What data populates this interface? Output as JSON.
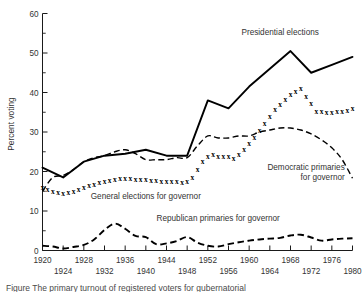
{
  "figure": {
    "caption_fragment": "Figure  The primary turnout of registered voters for gubernatorial"
  },
  "chart_data": {
    "type": "line",
    "title": "",
    "xlabel": "",
    "ylabel": "Percent voting",
    "xlim": [
      1920,
      1980
    ],
    "ylim": [
      0,
      60
    ],
    "grid": false,
    "legend_position": "inline-annotations",
    "yticks_major": [
      0,
      10,
      20,
      30,
      40,
      50,
      60
    ],
    "yticks_minor": [
      5,
      15,
      25,
      35,
      45,
      55
    ],
    "xticks_upper_row": [
      1920,
      1928,
      1936,
      1944,
      1952,
      1960,
      1968,
      1976
    ],
    "xticks_lower_row": [
      1924,
      1932,
      1940,
      1948,
      1956,
      1964,
      1972,
      1980
    ],
    "xticks_all": [
      1920,
      1924,
      1928,
      1932,
      1936,
      1940,
      1944,
      1948,
      1952,
      1956,
      1960,
      1964,
      1968,
      1972,
      1976,
      1980
    ],
    "series": [
      {
        "name": "Presidential elections",
        "style": "solid",
        "label_x": 1966,
        "label_y": 54.5,
        "x": [
          1920,
          1924,
          1928,
          1932,
          1936,
          1940,
          1944,
          1948,
          1952,
          1956,
          1960,
          1964,
          1968,
          1972,
          1976,
          1980
        ],
        "values": [
          21.0,
          18.5,
          22.5,
          24.0,
          24.5,
          25.5,
          24.0,
          24.0,
          38.0,
          36.0,
          41.5,
          46.0,
          50.5,
          45.0,
          47.0,
          49.0
        ]
      },
      {
        "name": "Democratic primaries for governor",
        "style": "dashed",
        "label_x": 1972,
        "label_y": 20.5,
        "x": [
          1920,
          1922,
          1924,
          1926,
          1928,
          1930,
          1932,
          1934,
          1936,
          1938,
          1940,
          1942,
          1944,
          1946,
          1948,
          1950,
          1952,
          1954,
          1956,
          1958,
          1960,
          1962,
          1964,
          1966,
          1968,
          1970,
          1972,
          1974,
          1976,
          1978,
          1980
        ],
        "values": [
          15.0,
          18.5,
          19.0,
          20.5,
          22.5,
          23.5,
          24.0,
          25.0,
          25.5,
          24.5,
          23.0,
          23.0,
          23.0,
          23.5,
          23.5,
          26.5,
          29.0,
          28.5,
          28.5,
          29.0,
          29.0,
          30.0,
          30.5,
          31.0,
          31.0,
          30.5,
          29.5,
          28.0,
          26.0,
          23.0,
          18.3
        ]
      },
      {
        "name": "General elections for governor",
        "style": "x-markers",
        "label_x": 1940,
        "label_y": 13.0,
        "x": [
          1920,
          1921,
          1922,
          1923,
          1924,
          1925,
          1926,
          1927,
          1928,
          1929,
          1930,
          1931,
          1932,
          1933,
          1934,
          1935,
          1936,
          1937,
          1938,
          1939,
          1940,
          1941,
          1942,
          1943,
          1944,
          1945,
          1946,
          1947,
          1948,
          1949,
          1950,
          1951,
          1952,
          1953,
          1954,
          1955,
          1956,
          1957,
          1958,
          1959,
          1960,
          1961,
          1962,
          1963,
          1964,
          1965,
          1966,
          1967,
          1968,
          1969,
          1970,
          1971,
          1972,
          1973,
          1974,
          1975,
          1976,
          1977,
          1978,
          1979,
          1980
        ],
        "values": [
          16.0,
          15.5,
          15.0,
          14.6,
          14.5,
          14.7,
          15.0,
          15.5,
          16.0,
          16.4,
          16.8,
          17.2,
          17.4,
          17.8,
          18.0,
          18.2,
          18.3,
          18.2,
          18.0,
          18.0,
          17.9,
          17.8,
          17.7,
          17.6,
          17.5,
          17.4,
          17.4,
          17.3,
          17.4,
          18.4,
          20.5,
          22.5,
          23.8,
          24.4,
          23.9,
          23.8,
          23.7,
          23.2,
          24.3,
          25.5,
          27.0,
          28.7,
          30.5,
          32.3,
          34.0,
          35.6,
          37.0,
          38.3,
          39.5,
          40.3,
          41.0,
          39.0,
          37.3,
          35.3,
          35.2,
          35.0,
          35.0,
          35.1,
          35.2,
          35.5,
          36.0
        ]
      },
      {
        "name": "Republican primaries for governor",
        "style": "dashed-heavy",
        "label_x": 1954,
        "label_y": 7.4,
        "x": [
          1920,
          1922,
          1924,
          1926,
          1928,
          1930,
          1932,
          1934,
          1936,
          1938,
          1940,
          1942,
          1944,
          1946,
          1948,
          1950,
          1952,
          1954,
          1956,
          1958,
          1960,
          1962,
          1964,
          1966,
          1968,
          1970,
          1972,
          1974,
          1976,
          1978,
          1980
        ],
        "values": [
          1.2,
          1.0,
          0.5,
          0.9,
          1.4,
          2.8,
          5.2,
          6.8,
          5.5,
          3.7,
          3.4,
          1.6,
          1.8,
          2.4,
          3.4,
          2.0,
          1.2,
          1.0,
          1.6,
          2.1,
          2.5,
          2.8,
          3.0,
          3.2,
          3.8,
          4.0,
          3.3,
          2.5,
          2.8,
          3.0,
          3.1
        ]
      }
    ]
  },
  "labels": {
    "presidential": "Presidential elections",
    "democratic_line1": "Democratic primaries",
    "democratic_line2": "for governor",
    "general": "General elections for governor",
    "republican": "Republican primaries for governor",
    "ylabel": "Percent voting"
  }
}
